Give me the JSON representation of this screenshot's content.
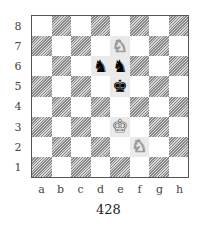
{
  "diagram": {
    "caption": "428",
    "ranks": [
      "8",
      "7",
      "6",
      "5",
      "4",
      "3",
      "2",
      "1"
    ],
    "files": [
      "a",
      "b",
      "c",
      "d",
      "e",
      "f",
      "g",
      "h"
    ],
    "pieces": [
      {
        "square": "e7",
        "color": "white",
        "type": "knight",
        "glyph": "♘"
      },
      {
        "square": "d6",
        "color": "black",
        "type": "knight",
        "glyph": "♞"
      },
      {
        "square": "e6",
        "color": "black",
        "type": "knight",
        "glyph": "♞"
      },
      {
        "square": "e5",
        "color": "black",
        "type": "king",
        "glyph": "♚"
      },
      {
        "square": "e3",
        "color": "white",
        "type": "king",
        "glyph": "♔"
      },
      {
        "square": "f2",
        "color": "white",
        "type": "knight",
        "glyph": "♘"
      }
    ],
    "colors": {
      "dark_square_hatch": "#8a8a8a",
      "light_square": "#ffffff",
      "border": "#555555"
    }
  }
}
